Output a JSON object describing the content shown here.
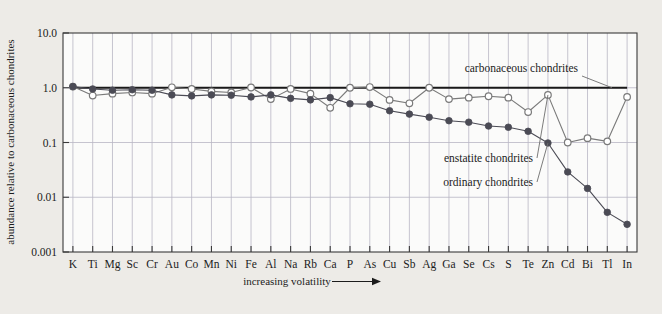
{
  "chart_data": {
    "type": "line",
    "title": "",
    "xlabel": "increasing volatility",
    "xlabel_arrow": "⟶",
    "ylabel": "abundance relative to carbonaceous chondrites",
    "ylim": [
      0.001,
      10.0
    ],
    "yscale": "log",
    "ytick_labels": [
      "10.0",
      "1.0",
      "0.1",
      "0.01",
      "0.001"
    ],
    "ytick_values": [
      10.0,
      1.0,
      0.1,
      0.01,
      0.001
    ],
    "grid": true,
    "legend_position": "inline-annotations",
    "categories": [
      "K",
      "Ti",
      "Mg",
      "Sc",
      "Cr",
      "Au",
      "Co",
      "Mn",
      "Ni",
      "Fe",
      "Al",
      "Na",
      "Rb",
      "Ca",
      "P",
      "As",
      "Cu",
      "Sb",
      "Ag",
      "Ga",
      "Se",
      "Cs",
      "S",
      "Te",
      "Zn",
      "Cd",
      "Bi",
      "Tl",
      "In"
    ],
    "series": [
      {
        "name": "carbonaceous chondrites",
        "marker": "none",
        "color": "#1a1a1a",
        "values": [
          1,
          1,
          1,
          1,
          1,
          1,
          1,
          1,
          1,
          1,
          1,
          1,
          1,
          1,
          1,
          1,
          1,
          1,
          1,
          1,
          1,
          1,
          1,
          1,
          1,
          1,
          1,
          1,
          1
        ]
      },
      {
        "name": "enstatite chondrites",
        "marker": "open-circle",
        "color": "#7a7a7a",
        "values": [
          1.05,
          0.72,
          0.78,
          0.82,
          0.78,
          1.02,
          0.95,
          0.86,
          0.82,
          1.01,
          0.62,
          0.95,
          0.78,
          0.43,
          1.0,
          1.03,
          0.6,
          0.52,
          1.0,
          0.62,
          0.66,
          0.7,
          0.66,
          0.36,
          0.74,
          0.1,
          0.12,
          0.105,
          0.68
        ]
      },
      {
        "name": "ordinary chondrites",
        "marker": "filled-circle",
        "color": "#4b4b55",
        "values": [
          1.05,
          0.95,
          0.9,
          0.92,
          0.9,
          0.74,
          0.71,
          0.74,
          0.73,
          0.68,
          0.74,
          0.64,
          0.6,
          0.66,
          0.51,
          0.5,
          0.38,
          0.33,
          0.29,
          0.25,
          0.235,
          0.2,
          0.19,
          0.16,
          0.098,
          0.029,
          0.0145,
          0.0053,
          0.0032
        ]
      }
    ],
    "annotations": [
      {
        "text": "carbonaceous chondrites",
        "series": "carbonaceous chondrites"
      },
      {
        "text": "enstatite chondrites",
        "series": "enstatite chondrites"
      },
      {
        "text": "ordinary chondrites",
        "series": "ordinary chondrites"
      }
    ]
  },
  "colors": {
    "page_background": "#edebe7",
    "plot_background": "#fbfbfa",
    "axis": "#3a3a3a",
    "grid": "#b9b6c4",
    "carbonaceous": "#1a1a1a",
    "enstatite": "#7a7a7a",
    "ordinary": "#4b4b55",
    "text": "#1c1c1c"
  }
}
